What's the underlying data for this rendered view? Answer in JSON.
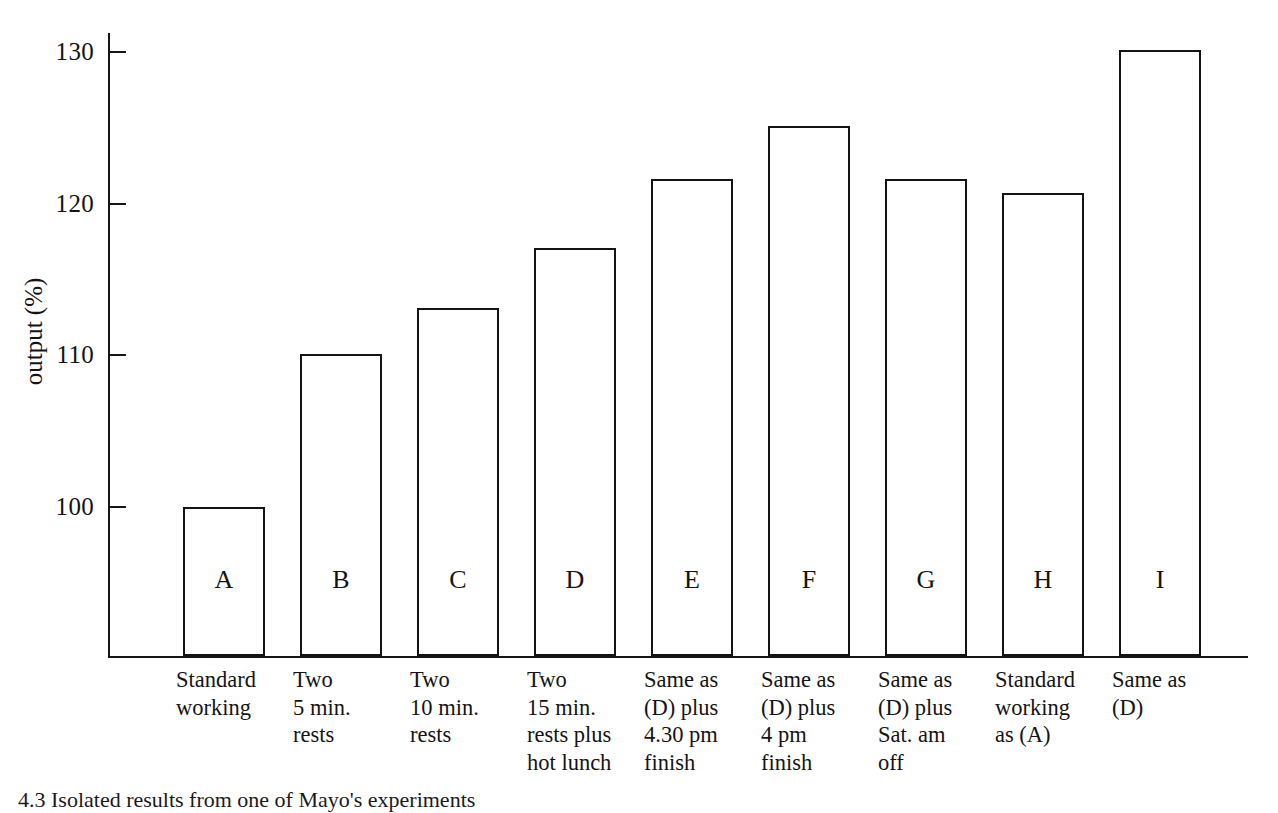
{
  "figure": {
    "caption": "4.3 Isolated results from one of Mayo's experiments"
  },
  "chart_data": {
    "type": "bar",
    "title": "",
    "xlabel": "",
    "ylabel": "output (%)",
    "ylim": [
      92,
      132
    ],
    "yticks": [
      100,
      110,
      120,
      130
    ],
    "ytick_labels": [
      "100",
      "110",
      "120",
      "130"
    ],
    "grid": false,
    "legend": null,
    "bar_style": "outline",
    "categories": [
      "A",
      "B",
      "C",
      "D",
      "E",
      "F",
      "G",
      "H",
      "I"
    ],
    "values": [
      100,
      110.1,
      113.1,
      117.1,
      121.6,
      125.1,
      121.6,
      120.7,
      130.1
    ],
    "category_descriptions": [
      [
        "Standard",
        "working"
      ],
      [
        "Two",
        "5 min.",
        "rests"
      ],
      [
        "Two",
        "10 min.",
        "rests"
      ],
      [
        "Two",
        "15 min.",
        "rests plus",
        "hot lunch"
      ],
      [
        "Same as",
        "(D) plus",
        "4.30 pm",
        "finish"
      ],
      [
        "Same as",
        "(D) plus",
        "4 pm",
        "finish"
      ],
      [
        "Same as",
        "(D) plus",
        "Sat. am",
        "off"
      ],
      [
        "Standard",
        "working",
        "as (A)"
      ],
      [
        "Same as",
        "(D)"
      ]
    ]
  },
  "colors": {
    "ink": "#141414",
    "background": "#ffffff"
  }
}
